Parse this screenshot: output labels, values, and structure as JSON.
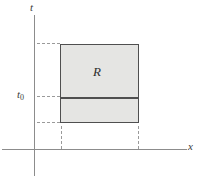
{
  "diagram": {
    "labels": {
      "t_axis": "t",
      "x_axis": "x",
      "t0_main": "t",
      "t0_sub": "0",
      "region": "R"
    },
    "colors": {
      "background": "#ffffff",
      "axis_color": "#8c8c8c",
      "dashed_color": "#9a9a9a",
      "rect_fill": "#e5e5e3",
      "rect_border": "#4f4f4f",
      "label_color": "#3a3a3a"
    }
  }
}
